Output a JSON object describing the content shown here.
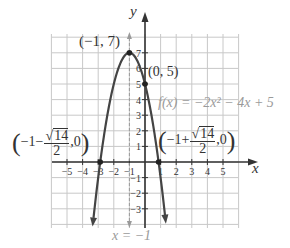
{
  "chart_data": {
    "type": "line",
    "title": "",
    "function_label": "f(x) = −2x² − 4x + 5",
    "xlabel": "x",
    "ylabel": "y",
    "xlim": [
      -5,
      5
    ],
    "ylim": [
      -3,
      7
    ],
    "grid": true,
    "x_ticks": [
      -5,
      -4,
      -3,
      -2,
      -1,
      1,
      2,
      3,
      4,
      5
    ],
    "y_ticks": [
      -3,
      -2,
      -1,
      1,
      2,
      3,
      4,
      5,
      6,
      7
    ],
    "series": [
      {
        "name": "f(x) = -2x^2 - 4x + 5",
        "kind": "parabola",
        "coefficients": {
          "a": -2,
          "b": -4,
          "c": 5
        },
        "color": "#444444",
        "x": [
          -3.3,
          -3,
          -2.5,
          -2,
          -1.5,
          -1,
          -0.5,
          0,
          0.5,
          0.87,
          1.3
        ],
        "y": [
          -3.38,
          -1,
          2.5,
          5,
          6.5,
          7,
          6.5,
          5,
          2.5,
          0,
          -3.98
        ]
      }
    ],
    "points": [
      {
        "label": "(−1, 7)",
        "x": -1,
        "y": 7,
        "role": "vertex"
      },
      {
        "label": "(0, 5)",
        "x": 0,
        "y": 5,
        "role": "y-intercept"
      },
      {
        "label": "(−1 − √14/2, 0)",
        "x": -2.87,
        "y": 0,
        "role": "x-intercept"
      },
      {
        "label": "(−1 + √14/2, 0)",
        "x": 0.87,
        "y": 0,
        "role": "x-intercept"
      }
    ],
    "axis_of_symmetry": {
      "label": "x = −1",
      "x": -1,
      "style": "dashed",
      "color": "#9a9a9a"
    },
    "colors": {
      "grid": "#c8c8c8",
      "axes": "#333333",
      "curve": "#444444",
      "symmetry": "#9a9a9a"
    }
  },
  "labels": {
    "y_axis": "y",
    "x_axis": "x",
    "vertex": "(−1, 7)",
    "y_intercept": "(0, 5)",
    "function": "f(x) = −2x² − 4x + 5",
    "axis_of_symmetry": "x = −1",
    "left_intercept": {
      "prefix": "−1−",
      "num": "14",
      "den": "2",
      "suffix": ",0"
    },
    "right_intercept": {
      "prefix": "−1+",
      "num": "14",
      "den": "2",
      "suffix": ",0"
    }
  }
}
